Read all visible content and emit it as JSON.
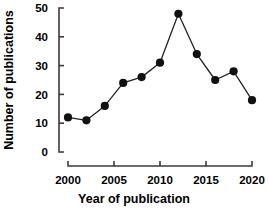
{
  "chart_data": {
    "type": "line",
    "title": "",
    "xlabel": "Year of publication",
    "ylabel": "Number of publications",
    "x": [
      2000,
      2002,
      2004,
      2006,
      2008,
      2010,
      2012,
      2014,
      2016,
      2018,
      2020
    ],
    "values": [
      12,
      11,
      16,
      24,
      26,
      31,
      48,
      34,
      25,
      28,
      18
    ],
    "series": [
      {
        "name": "Number of publications",
        "values": [
          12,
          11,
          16,
          24,
          26,
          31,
          48,
          34,
          25,
          28,
          18
        ]
      }
    ],
    "xlim": [
      2000,
      2020
    ],
    "ylim": [
      0,
      50
    ],
    "xticks": [
      2000,
      2005,
      2010,
      2015,
      2020
    ],
    "yticks": [
      0,
      10,
      20,
      30,
      40,
      50
    ],
    "xtick_labels": [
      "2000",
      "2005",
      "2010",
      "2015",
      "2020"
    ],
    "ytick_labels": [
      "0",
      "10",
      "20",
      "30",
      "40",
      "50"
    ],
    "grid": false,
    "legend": "none",
    "marker": "filled-circle",
    "line_color": "#222222",
    "marker_color": "#111111",
    "axis_color": "#3a3a3a"
  }
}
